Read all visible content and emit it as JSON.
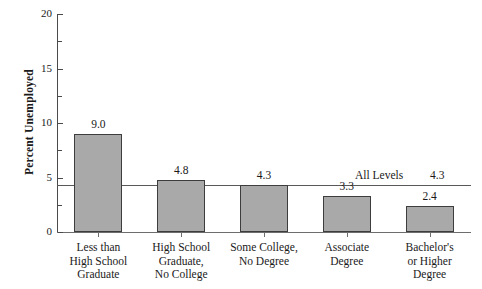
{
  "chart_data": {
    "type": "bar",
    "title": "",
    "xlabel": "",
    "ylabel": "Percent Unemployed",
    "categories": [
      "Less than\nHigh School\nGraduate",
      "High School\nGraduate,\nNo College",
      "Some College,\nNo Degree",
      "Associate\nDegree",
      "Bachelor's\nor Higher\nDegree"
    ],
    "category_lines": [
      [
        "Less than",
        "High School",
        "Graduate"
      ],
      [
        "High School",
        "Graduate,",
        "No College"
      ],
      [
        "Some College,",
        "No Degree"
      ],
      [
        "Associate",
        "Degree"
      ],
      [
        "Bachelor's",
        "or Higher",
        "Degree"
      ]
    ],
    "values": [
      9.0,
      4.8,
      4.3,
      3.3,
      2.4
    ],
    "value_labels": [
      "9.0",
      "4.8",
      "4.3",
      "3.3",
      "2.4"
    ],
    "ylim": [
      0,
      20
    ],
    "yticks": [
      0,
      5,
      10,
      15,
      20
    ],
    "ytick_labels": [
      "0",
      "5",
      "10",
      "15",
      "20"
    ],
    "yticks_minor": [
      2.5,
      7.5,
      12.5,
      17.5
    ],
    "grid": false,
    "legend": "none",
    "reference_line": {
      "label": "All Levels",
      "value": 4.3,
      "value_label": "4.3"
    },
    "colors": {
      "bar_fill": "#a9a9a9",
      "bar_border": "#3d3d3d",
      "axis": "#4a4a4a",
      "reference_line": "#595959",
      "text": "#1a1a1a",
      "background": "#ffffff"
    }
  }
}
